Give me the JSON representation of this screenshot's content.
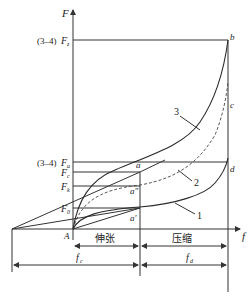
{
  "diagram": {
    "axes": {
      "y_label": "F",
      "x_label": "f"
    },
    "force_levels": [
      {
        "id": "Fz",
        "prefix": "(3–4)",
        "symbol": "F",
        "subscript": "z"
      },
      {
        "id": "Fa",
        "prefix": "(3–4)",
        "symbol": "F",
        "subscript": "a"
      },
      {
        "id": "Fc",
        "prefix": "",
        "symbol": "F",
        "subscript": "c"
      },
      {
        "id": "Fk",
        "prefix": "",
        "symbol": "F",
        "subscript": "k"
      },
      {
        "id": "F0",
        "prefix": "",
        "symbol": "F",
        "subscript": "0"
      }
    ],
    "points": {
      "A": "A",
      "a": "a",
      "a_prime": "a′",
      "a_double_prime": "a″",
      "b": "b",
      "c": "c",
      "d": "d"
    },
    "curves": [
      {
        "id": "1",
        "label": "1",
        "style": "solid"
      },
      {
        "id": "2",
        "label": "2",
        "style": "dashed"
      },
      {
        "id": "3",
        "label": "3",
        "style": "solid"
      }
    ],
    "regions": {
      "tension": "伸张",
      "compression": "压缩"
    },
    "dimensions": {
      "fc": {
        "symbol": "f",
        "subscript": "c"
      },
      "fd": {
        "symbol": "f",
        "subscript": "d"
      }
    },
    "colors": {
      "line": "#333333",
      "text": "#222222",
      "background": "#ffffff"
    }
  }
}
